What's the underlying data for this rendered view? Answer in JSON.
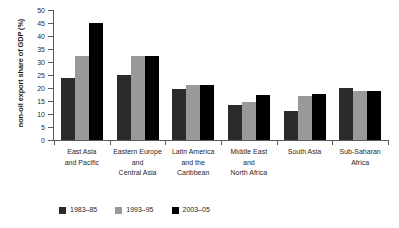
{
  "chart_data": {
    "type": "bar",
    "title": "",
    "subtitle": "",
    "xlabel": "",
    "ylabel": "non-oil export share of GDP (%)",
    "ylim": [
      0,
      50
    ],
    "ytick_step": 5,
    "yticks": [
      0,
      5,
      10,
      15,
      20,
      25,
      30,
      35,
      40,
      45,
      50
    ],
    "ytick_labels": [
      "0",
      "5",
      "10",
      "15",
      "20",
      "25",
      "30",
      "35",
      "40",
      "45",
      "50"
    ],
    "grid": false,
    "legend_position": "bottom-left",
    "categories": [
      "East Asia\nand Pacific",
      "Eastern Europe\nand\nCentral Asia",
      "Latin America\nand the\nCaribbean",
      "Middle East\nand\nNorth Africa",
      "South Asia",
      "Sub-Saharan\nAfrica"
    ],
    "series": [
      {
        "name": "1983–85",
        "color": "#2b2b2b",
        "values": [
          23.9,
          25.1,
          19.5,
          13.6,
          11.1,
          19.9
        ]
      },
      {
        "name": "1993–95",
        "color": "#999999",
        "values": [
          32.2,
          32.2,
          21.2,
          14.8,
          16.8,
          18.8
        ]
      },
      {
        "name": "2003–05",
        "color": "#000000",
        "values": [
          45.0,
          32.4,
          21.3,
          17.3,
          17.6,
          18.7
        ]
      }
    ]
  },
  "colors": {
    "axis": "#5a5a5a",
    "text": "#1f1f1f",
    "background": "#ffffff",
    "series_1983_85": "#2b2b2b",
    "series_1993_95": "#999999",
    "series_2003_05": "#000000"
  }
}
